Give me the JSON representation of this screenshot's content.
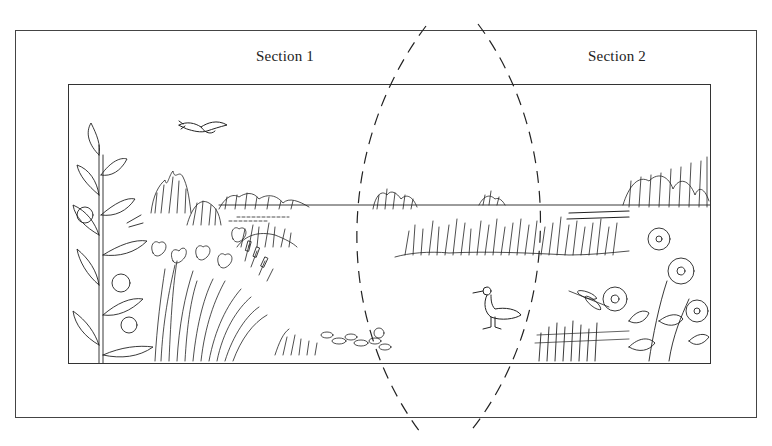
{
  "figure": {
    "sections": [
      {
        "id": 1,
        "label": "Section 1"
      },
      {
        "id": 2,
        "label": "Section 2"
      }
    ],
    "overlap_marker": "dashed-lens-shape",
    "colors": {
      "ink": "#222222",
      "frame": "#444444",
      "background": "#ffffff"
    },
    "elements": [
      "flying-duck-icon",
      "distant-shrubs",
      "horizon-line",
      "tall-flowering-plant-left",
      "iris-and-cattail-clump",
      "grass-tuft",
      "lily-pads",
      "reed-bank-right",
      "grebe-bird-icon",
      "dragonfly-icon",
      "wild-rose-bush-right"
    ]
  }
}
